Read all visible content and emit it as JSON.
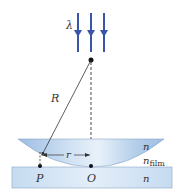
{
  "diagram": {
    "type": "newtons-rings",
    "labels": {
      "wavelength": "λ",
      "radius": "R",
      "distance": "r",
      "point_p": "P",
      "point_o": "O",
      "lens_index": "n",
      "film_index": "n",
      "film_subscript": "film",
      "plate_index": "n"
    },
    "colors": {
      "arrow": "#3a55a8",
      "lens": "#a9c7e8",
      "plate": "#cfe0f2",
      "line": "#333333"
    }
  }
}
